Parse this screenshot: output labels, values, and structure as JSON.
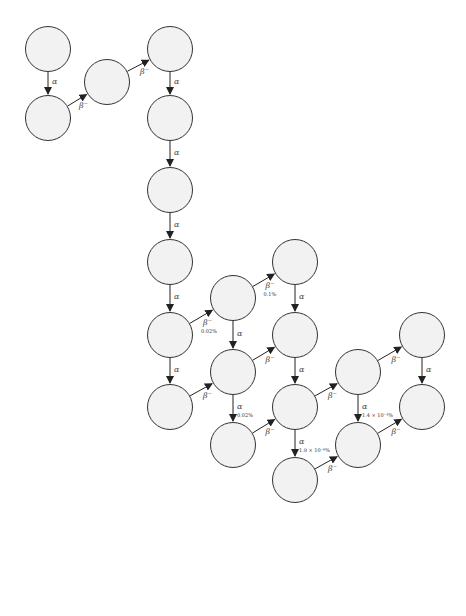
{
  "diagram": {
    "nodes": [
      {
        "id": "U238",
        "mass": "238",
        "z": "92",
        "symbol": "U",
        "half_life": "4.47 × 10⁹ y",
        "x": 48,
        "y": 49
      },
      {
        "id": "Th234",
        "mass": "234",
        "z": "90",
        "symbol": "Th",
        "half_life": "24.1 d",
        "x": 48,
        "y": 118
      },
      {
        "id": "Pa234",
        "mass": "234",
        "z": "91",
        "symbol": "Pa",
        "half_life": "6.70 h",
        "x": 107,
        "y": 82
      },
      {
        "id": "U234",
        "mass": "234",
        "z": "92",
        "symbol": "U",
        "half_life": "2.46 × 10⁵ y",
        "x": 170,
        "y": 49
      },
      {
        "id": "Th230",
        "mass": "230",
        "z": "90",
        "symbol": "Th",
        "half_life": "7.54 × 10⁴ y",
        "x": 170,
        "y": 118
      },
      {
        "id": "Ra226",
        "mass": "226",
        "z": "88",
        "symbol": "Ra",
        "half_life": "1.60 × 10³ y",
        "x": 170,
        "y": 190
      },
      {
        "id": "Rn222",
        "mass": "222",
        "z": "86",
        "symbol": "Rn",
        "half_life": "3.82 d",
        "x": 170,
        "y": 262
      },
      {
        "id": "Po218",
        "mass": "218",
        "z": "84",
        "symbol": "Po",
        "half_life": "3.10 m",
        "x": 170,
        "y": 335
      },
      {
        "id": "Pb214",
        "mass": "214",
        "z": "82",
        "symbol": "Pb",
        "half_life": "26.8 m",
        "x": 170,
        "y": 407
      },
      {
        "id": "At218",
        "mass": "218",
        "z": "85",
        "symbol": "At",
        "half_life": "1.5 s",
        "x": 233,
        "y": 298
      },
      {
        "id": "Bi214",
        "mass": "214",
        "z": "83",
        "symbol": "Bi",
        "half_life": "19.9 m",
        "x": 233,
        "y": 372
      },
      {
        "id": "Tl210",
        "mass": "210",
        "z": "81",
        "symbol": "Tl",
        "half_life": "1.3 m",
        "x": 233,
        "y": 445
      },
      {
        "id": "Rn218",
        "mass": "218",
        "z": "86",
        "symbol": "Rn",
        "half_life": "3.5 × 10⁻² s",
        "x": 295,
        "y": 262
      },
      {
        "id": "Po214",
        "mass": "214",
        "z": "84",
        "symbol": "Po",
        "half_life": "1.64 × 10⁻⁴ s",
        "x": 295,
        "y": 335
      },
      {
        "id": "Pb210",
        "mass": "210",
        "z": "82",
        "symbol": "Pb",
        "half_life": "22.2 y",
        "x": 295,
        "y": 407
      },
      {
        "id": "Hg206",
        "mass": "206",
        "z": "80",
        "symbol": "Hg",
        "half_life": "8.32 m",
        "x": 295,
        "y": 480
      },
      {
        "id": "Bi210",
        "mass": "210",
        "z": "83",
        "symbol": "Bi",
        "half_life": "5.02 d",
        "x": 358,
        "y": 372
      },
      {
        "id": "Tl206",
        "mass": "206",
        "z": "81",
        "symbol": "Tl",
        "half_life": "4.20 m",
        "x": 358,
        "y": 445
      },
      {
        "id": "Po210",
        "mass": "210",
        "z": "84",
        "symbol": "Po",
        "half_life": "138 d",
        "x": 422,
        "y": 335
      },
      {
        "id": "Pb206",
        "mass": "206",
        "z": "82",
        "symbol": "Pb",
        "half_life": "stable",
        "x": 422,
        "y": 407
      }
    ],
    "edges": [
      {
        "from": "U238",
        "to": "Th234",
        "label": "α",
        "branch": ""
      },
      {
        "from": "Th234",
        "to": "Pa234",
        "label": "β⁻",
        "branch": ""
      },
      {
        "from": "Pa234",
        "to": "U234",
        "label": "β⁻",
        "branch": ""
      },
      {
        "from": "U234",
        "to": "Th230",
        "label": "α",
        "branch": ""
      },
      {
        "from": "Th230",
        "to": "Ra226",
        "label": "α",
        "branch": ""
      },
      {
        "from": "Ra226",
        "to": "Rn222",
        "label": "α",
        "branch": ""
      },
      {
        "from": "Rn222",
        "to": "Po218",
        "label": "α",
        "branch": ""
      },
      {
        "from": "Po218",
        "to": "Pb214",
        "label": "α",
        "branch": ""
      },
      {
        "from": "Po218",
        "to": "At218",
        "label": "β⁻",
        "branch": "0.02%"
      },
      {
        "from": "At218",
        "to": "Bi214",
        "label": "α",
        "branch": ""
      },
      {
        "from": "At218",
        "to": "Rn218",
        "label": "β⁻",
        "branch": "0.1%"
      },
      {
        "from": "Rn218",
        "to": "Po214",
        "label": "α",
        "branch": ""
      },
      {
        "from": "Pb214",
        "to": "Bi214",
        "label": "β⁻",
        "branch": ""
      },
      {
        "from": "Bi214",
        "to": "Po214",
        "label": "β⁻",
        "branch": ""
      },
      {
        "from": "Bi214",
        "to": "Tl210",
        "label": "α",
        "branch": "0.02%"
      },
      {
        "from": "Po214",
        "to": "Pb210",
        "label": "α",
        "branch": ""
      },
      {
        "from": "Tl210",
        "to": "Pb210",
        "label": "β⁻",
        "branch": ""
      },
      {
        "from": "Pb210",
        "to": "Bi210",
        "label": "β⁻",
        "branch": ""
      },
      {
        "from": "Pb210",
        "to": "Hg206",
        "label": "α",
        "branch": "1.9 × 10⁻⁶%"
      },
      {
        "from": "Hg206",
        "to": "Tl206",
        "label": "β⁻",
        "branch": ""
      },
      {
        "from": "Bi210",
        "to": "Po210",
        "label": "β⁻",
        "branch": ""
      },
      {
        "from": "Bi210",
        "to": "Tl206",
        "label": "α",
        "branch": "1.4 × 10⁻⁴%"
      },
      {
        "from": "Tl206",
        "to": "Pb206",
        "label": "β⁻",
        "branch": ""
      },
      {
        "from": "Po210",
        "to": "Pb206",
        "label": "α",
        "branch": ""
      }
    ]
  },
  "colors": {
    "node_fill": "#f2f2f2",
    "node_stroke": "#333333",
    "edge": "#222222",
    "text": "#111111"
  }
}
